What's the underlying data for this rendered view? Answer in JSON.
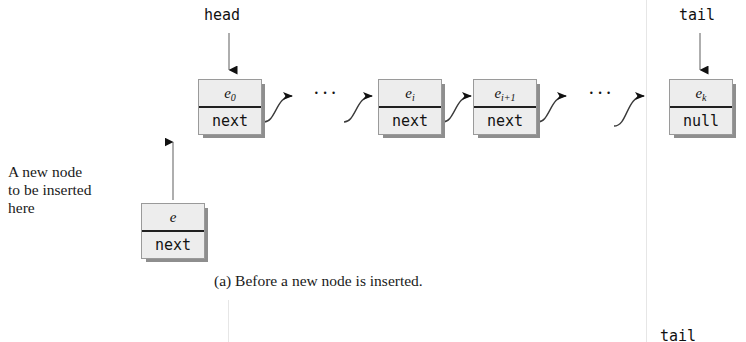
{
  "figure": {
    "caption": "(a) Before a new node is inserted.",
    "annotation_lines": [
      "A new node",
      "to be inserted",
      "here"
    ],
    "ellipsis": "···",
    "partial_bottom_label": "tail"
  },
  "pointers": {
    "head": "head",
    "tail": "tail"
  },
  "nodes": [
    {
      "id": "e0",
      "value": "e",
      "subscript": "0",
      "next": "next"
    },
    {
      "id": "ei",
      "value": "e",
      "subscript": "i",
      "next": "next"
    },
    {
      "id": "ei1",
      "value": "e",
      "subscript": "i+1",
      "next": "next"
    },
    {
      "id": "ek",
      "value": "e",
      "subscript": "k",
      "next": "null"
    },
    {
      "id": "enew",
      "value": "e",
      "subscript": "",
      "next": "next"
    }
  ],
  "colors": {
    "node_fill": "#ededed",
    "node_border": "#9a9a9a",
    "node_shadow": "#8e8e8e",
    "divider": "#202020",
    "ink": "#111111",
    "page": "#ffffff"
  }
}
